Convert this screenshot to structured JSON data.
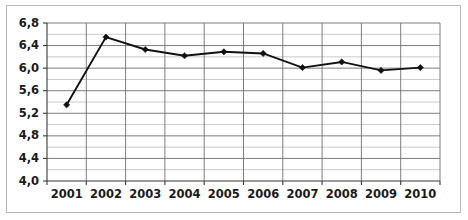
{
  "chart_data": {
    "type": "line",
    "title": "",
    "xlabel": "",
    "ylabel": "",
    "categories": [
      "2001",
      "2002",
      "2003",
      "2004",
      "2005",
      "2006",
      "2007",
      "2008",
      "2009",
      "2010"
    ],
    "values": [
      5.35,
      6.55,
      6.33,
      6.22,
      6.29,
      6.26,
      6.01,
      6.11,
      5.96,
      6.01
    ],
    "series": [
      {
        "name": "series-1",
        "values": [
          5.35,
          6.55,
          6.33,
          6.22,
          6.29,
          6.26,
          6.01,
          6.11,
          5.96,
          6.01
        ]
      }
    ],
    "ylim": [
      4.0,
      6.8
    ],
    "y_major_ticks": [
      "4,0",
      "4,4",
      "4,8",
      "5,2",
      "5,6",
      "6,0",
      "6,4",
      "6,8"
    ],
    "y_major_values": [
      4.0,
      4.4,
      4.8,
      5.2,
      5.6,
      6.0,
      6.4,
      6.8
    ],
    "y_minor_values": [
      4.2,
      4.6,
      5.0,
      5.4,
      5.8,
      6.2,
      6.6
    ],
    "decimal_separator": ",",
    "grid": {
      "horizontal_major": true,
      "horizontal_minor": true,
      "vertical": true
    },
    "legend": {
      "visible": false,
      "entries": []
    },
    "marker": "diamond",
    "line_color": "#111111",
    "grid_color_major": "#6f6f6f",
    "grid_color_minor": "#c4c4c4",
    "border_color": "#b9b9b9",
    "background_color": "#ffffff"
  }
}
